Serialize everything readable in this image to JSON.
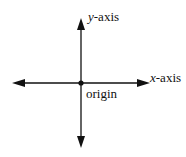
{
  "diagram": {
    "labels": {
      "y_axis_var": "y",
      "y_axis_suffix": "-axis",
      "x_axis_var": "x",
      "x_axis_suffix": "-axis",
      "origin": "origin"
    },
    "colors": {
      "stroke": "#111111",
      "background": "#ffffff"
    }
  }
}
